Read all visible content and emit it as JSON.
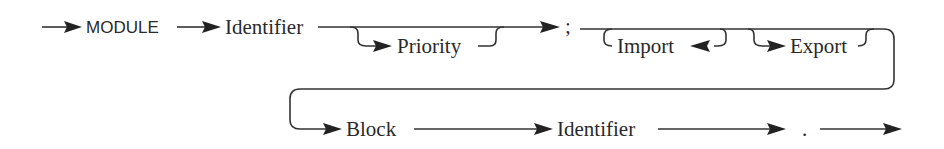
{
  "diagram": {
    "type": "syntax-diagram",
    "colors": {
      "ink": "#2a2a2a",
      "background": "#ffffff"
    },
    "row1": {
      "keyword": "MODULE",
      "name": "Identifier",
      "optional_priority": "Priority",
      "separator": ";",
      "import_loop": "Import",
      "export_loop": "Export"
    },
    "row2": {
      "body": "Block",
      "end_name": "Identifier",
      "terminator": "."
    }
  }
}
